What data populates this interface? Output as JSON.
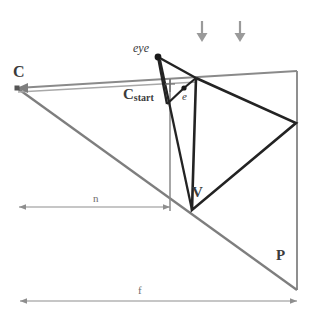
{
  "figure": {
    "colors": {
      "dark_line": "#222222",
      "gray_line": "#808080",
      "light_gray_line": "#9a9a9a",
      "arrow_gray": "#8e8e8e",
      "label_text": "#3b3b3b",
      "dim_label_text": "#6e6e6e",
      "background": "#ffffff"
    },
    "labels": {
      "camera": "C",
      "eye": "eye",
      "camera_start": "C",
      "camera_start_sub": "start",
      "eye_point": "e",
      "vertex": "V",
      "point_p": "P",
      "near_distance": "n",
      "far_distance": "f"
    },
    "points": {
      "C": {
        "x": 17,
        "y": 88,
        "label": "C"
      },
      "eye": {
        "x": 158,
        "y": 57,
        "label": "eye"
      },
      "e": {
        "x": 184,
        "y": 88,
        "label": "e"
      },
      "Cstart": {
        "x": 170,
        "y": 88,
        "label": "Cstart"
      },
      "V": {
        "x": 192,
        "y": 210,
        "label": "V"
      },
      "P": {
        "x": 297,
        "y": 290,
        "label": "P"
      },
      "apex_top": {
        "x": 196,
        "y": 78,
        "label": ""
      },
      "apex_right": {
        "x": 296,
        "y": 123,
        "label": ""
      }
    },
    "segments": {
      "near_plane_extent": {
        "from_x": 19,
        "to_x": 170,
        "y": 207,
        "label": "n"
      },
      "far_plane_extent": {
        "from_x": 20,
        "to_x": 297,
        "y": 301,
        "label": "f"
      }
    },
    "arrows": {
      "count": 2,
      "direction": "down",
      "positions": [
        {
          "x": 202,
          "y_top": 22,
          "y_bottom": 41
        },
        {
          "x": 240,
          "y_top": 22,
          "y_bottom": 41
        }
      ]
    }
  }
}
